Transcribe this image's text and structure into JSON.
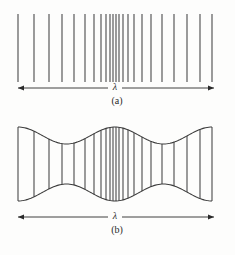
{
  "figure": {
    "background_color": "#fdfdfc",
    "line_color": "#4a4a4a",
    "envelope_color": "#3d3d3d",
    "text_color": "#2a2a2a",
    "panels": [
      {
        "id": "panel-a",
        "caption": "(a)",
        "wavelength_label": "λ",
        "caption_x": 117,
        "caption_y": 104,
        "lambda_x": 115,
        "lambda_y": 90,
        "arrow": {
          "x1": 18,
          "x2": 214,
          "y": 88
        },
        "lines_top": 14,
        "lines_bottom": 82,
        "line_positions": [
          18,
          34,
          49,
          62,
          74,
          85,
          94,
          101,
          106,
          110,
          113,
          116,
          119,
          123,
          128,
          134,
          142,
          151,
          162,
          174,
          187,
          200,
          212
        ]
      },
      {
        "id": "panel-b",
        "caption": "(b)",
        "wavelength_label": "λ",
        "caption_x": 117,
        "caption_y": 233,
        "lambda_x": 115,
        "lambda_y": 219,
        "arrow": {
          "x1": 18,
          "x2": 214,
          "y": 217
        },
        "center_y": 164,
        "amplitude_max": 37,
        "amplitude_min": 20,
        "envelope_cycles": 1,
        "line_positions": [
          18,
          34,
          49,
          62,
          74,
          85,
          94,
          101,
          106,
          110,
          113,
          116,
          119,
          123,
          128,
          134,
          142,
          151,
          162,
          174,
          187,
          200,
          212
        ]
      }
    ]
  },
  "chart_data": {
    "type": "line",
    "title": "",
    "subtitle": "",
    "xlabel": "",
    "ylabel": "",
    "x": [
      18,
      34,
      49,
      62,
      74,
      85,
      94,
      101,
      106,
      110,
      113,
      116,
      119,
      123,
      128,
      134,
      142,
      151,
      162,
      174,
      187,
      200,
      212
    ],
    "series": [
      {
        "name": "panel-a line density",
        "values": [
          16,
          15,
          13,
          12,
          11,
          9,
          7,
          5,
          4,
          3,
          3,
          3,
          4,
          5,
          6,
          8,
          9,
          11,
          12,
          13,
          13,
          12,
          12
        ]
      },
      {
        "name": "panel-b envelope amplitude",
        "values": [
          37,
          32,
          26,
          22,
          21,
          23,
          28,
          33,
          36,
          37,
          37,
          37,
          37,
          36,
          34,
          31,
          27,
          23,
          21,
          22,
          26,
          32,
          37
        ]
      }
    ],
    "annotations": [
      "λ",
      "(a)",
      "(b)"
    ],
    "grid": false,
    "legend": "none",
    "xlim": [
      18,
      212
    ],
    "ylim": [
      0,
      40
    ]
  }
}
